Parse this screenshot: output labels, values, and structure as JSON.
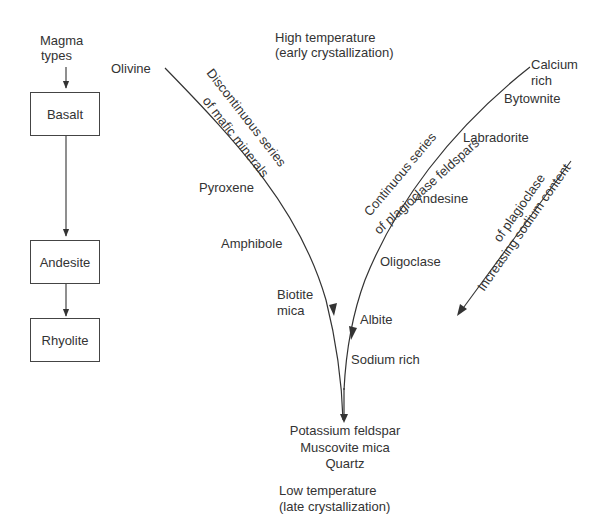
{
  "magma_column": {
    "title_line1": "Magma",
    "title_line2": "types",
    "boxes": [
      "Basalt",
      "Andesite",
      "Rhyolite"
    ]
  },
  "top": {
    "line1": "High temperature",
    "line2": "(early crystallization)"
  },
  "bottom": {
    "line1": "Low temperature",
    "line2": "(late crystallization)"
  },
  "discontinuous": {
    "series_label_line1": "Discontinuous series",
    "series_label_line2": "of mafic minerals",
    "minerals": [
      "Olivine",
      "Pyroxene",
      "Amphibole",
      "Biotite",
      "mica"
    ]
  },
  "continuous": {
    "series_label_line1": "Continuous series",
    "series_label_line2": "of plagioclase feldspars",
    "top_label_line1": "Calcium",
    "top_label_line2": "rich",
    "minerals": [
      "Bytownite",
      "Labradorite",
      "Andesine",
      "Oligoclase",
      "Albite"
    ],
    "bottom_label": "Sodium rich"
  },
  "sodium_arrow": {
    "line1": "Increasing sodium content",
    "line2": "of plagioclase"
  },
  "final_products": [
    "Potassium feldspar",
    "Muscovite mica",
    "Quartz"
  ]
}
